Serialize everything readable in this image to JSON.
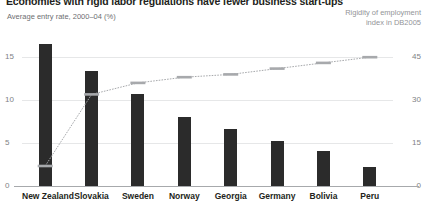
{
  "title": "Economies with rigid labor regulations have fewer business start-ups",
  "left_axis_caption": "Average entry rate, 2000–04 (%)",
  "right_axis_caption_line1": "Rigidity of employment",
  "right_axis_caption_line2": "index in DB2005",
  "colors": {
    "bar": "#2b2b2b",
    "line": "#a7a9ac",
    "grid": "#e6e7e8",
    "axis": "#a7a9ac",
    "title_text": "#231f20",
    "tick_text": "#808285",
    "caption_left": "#6d6e71",
    "caption_right": "#939598"
  },
  "chart_data": {
    "type": "bar",
    "title": "Economies with rigid labor regulations have fewer business start-ups",
    "subtitle": "",
    "xlabel": "",
    "ylabel": "Average entry rate, 2000–04 (%)",
    "y2label": "Rigidity of employment index in DB2005",
    "grid": true,
    "legend": "none",
    "categories": [
      "New Zealand",
      "Slovakia",
      "Sweden",
      "Norway",
      "Georgia",
      "Germany",
      "Bolivia",
      "Peru"
    ],
    "ylim": [
      0,
      17
    ],
    "y2lim": [
      0,
      51
    ],
    "yticks": [
      "15",
      "10",
      "5",
      "0"
    ],
    "ytick_values": [
      15,
      10,
      5,
      0
    ],
    "y2ticks": [
      "45",
      "30",
      "15",
      "0"
    ],
    "y2tick_values": [
      45,
      30,
      15,
      0
    ],
    "series": [
      {
        "name": "Average entry rate, 2000-04 (%)",
        "type": "bar",
        "axis": "left",
        "values": [
          16.5,
          13.4,
          10.7,
          8.0,
          6.7,
          5.3,
          4.1,
          2.2
        ]
      },
      {
        "name": "Rigidity of employment index in DB2005",
        "type": "line",
        "axis": "right",
        "values": [
          7,
          32,
          36,
          38,
          39,
          41,
          43,
          45
        ]
      }
    ]
  }
}
